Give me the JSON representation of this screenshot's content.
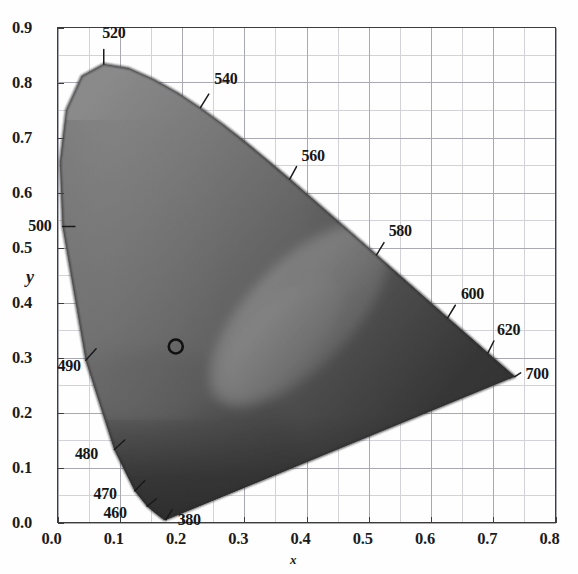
{
  "figure": {
    "kind": "cie-1931-chromaticity-diagram",
    "rendering": "grayscale halftone scan",
    "background_color": "#fefefe",
    "frame_color": "#4a4a4a",
    "grid_color": "#a8a8b0",
    "minor_grid_color": "#cfcfd6",
    "locus_outline_color": "#2a2a2a"
  },
  "axes": {
    "x_title": "x",
    "y_title": "y",
    "x_ticks": [
      "0.0",
      "0.1",
      "0.2",
      "0.3",
      "0.4",
      "0.5",
      "0.6",
      "0.7",
      "0.8"
    ],
    "y_ticks": [
      "0.0",
      "0.1",
      "0.2",
      "0.3",
      "0.4",
      "0.5",
      "0.6",
      "0.7",
      "0.8",
      "0.9"
    ],
    "x_range": [
      0.0,
      0.8
    ],
    "y_range": [
      0.0,
      0.9
    ],
    "major_step": 0.1,
    "minor_step": 0.05,
    "grid": true
  },
  "chart_data": {
    "type": "scatter",
    "title": "",
    "xlabel": "x",
    "ylabel": "y",
    "xlim": [
      0.0,
      0.8
    ],
    "ylim": [
      0.0,
      0.9
    ],
    "grid": true,
    "legend": "none",
    "spectral_locus": {
      "name": "spectral locus (CIE 1931 2-deg)",
      "closed_by": "line of purples",
      "points": [
        {
          "wl": 380,
          "x": 0.1741,
          "y": 0.005
        },
        {
          "wl": 390,
          "x": 0.1738,
          "y": 0.0049
        },
        {
          "wl": 400,
          "x": 0.1733,
          "y": 0.0048
        },
        {
          "wl": 410,
          "x": 0.1726,
          "y": 0.0048
        },
        {
          "wl": 420,
          "x": 0.1714,
          "y": 0.0051
        },
        {
          "wl": 430,
          "x": 0.1689,
          "y": 0.0069
        },
        {
          "wl": 440,
          "x": 0.1644,
          "y": 0.0109
        },
        {
          "wl": 450,
          "x": 0.1566,
          "y": 0.0177
        },
        {
          "wl": 460,
          "x": 0.144,
          "y": 0.0297
        },
        {
          "wl": 470,
          "x": 0.1241,
          "y": 0.0578
        },
        {
          "wl": 480,
          "x": 0.0913,
          "y": 0.1327
        },
        {
          "wl": 490,
          "x": 0.0454,
          "y": 0.295
        },
        {
          "wl": 500,
          "x": 0.0082,
          "y": 0.5384
        },
        {
          "wl": 505,
          "x": 0.0039,
          "y": 0.6548
        },
        {
          "wl": 510,
          "x": 0.0139,
          "y": 0.7502
        },
        {
          "wl": 515,
          "x": 0.0389,
          "y": 0.812
        },
        {
          "wl": 520,
          "x": 0.0743,
          "y": 0.8338
        },
        {
          "wl": 525,
          "x": 0.1142,
          "y": 0.8262
        },
        {
          "wl": 530,
          "x": 0.1547,
          "y": 0.8059
        },
        {
          "wl": 535,
          "x": 0.1929,
          "y": 0.7816
        },
        {
          "wl": 540,
          "x": 0.2296,
          "y": 0.7543
        },
        {
          "wl": 545,
          "x": 0.2658,
          "y": 0.7243
        },
        {
          "wl": 550,
          "x": 0.3016,
          "y": 0.6923
        },
        {
          "wl": 555,
          "x": 0.3373,
          "y": 0.6589
        },
        {
          "wl": 560,
          "x": 0.3731,
          "y": 0.6245
        },
        {
          "wl": 565,
          "x": 0.4087,
          "y": 0.5896
        },
        {
          "wl": 570,
          "x": 0.4441,
          "y": 0.5547
        },
        {
          "wl": 575,
          "x": 0.4788,
          "y": 0.5202
        },
        {
          "wl": 580,
          "x": 0.5125,
          "y": 0.4866
        },
        {
          "wl": 585,
          "x": 0.5448,
          "y": 0.4544
        },
        {
          "wl": 590,
          "x": 0.5752,
          "y": 0.4242
        },
        {
          "wl": 595,
          "x": 0.6029,
          "y": 0.3965
        },
        {
          "wl": 600,
          "x": 0.627,
          "y": 0.3725
        },
        {
          "wl": 605,
          "x": 0.6482,
          "y": 0.3514
        },
        {
          "wl": 610,
          "x": 0.6658,
          "y": 0.334
        },
        {
          "wl": 620,
          "x": 0.6915,
          "y": 0.3083
        },
        {
          "wl": 630,
          "x": 0.7079,
          "y": 0.292
        },
        {
          "wl": 640,
          "x": 0.719,
          "y": 0.2809
        },
        {
          "wl": 650,
          "x": 0.726,
          "y": 0.274
        },
        {
          "wl": 660,
          "x": 0.73,
          "y": 0.27
        },
        {
          "wl": 680,
          "x": 0.7334,
          "y": 0.2666
        },
        {
          "wl": 700,
          "x": 0.7347,
          "y": 0.2653
        }
      ]
    },
    "wavelength_labels": [
      {
        "text": "520",
        "wl": 520,
        "label_x": 0.072,
        "label_y": 0.888,
        "tick_from": [
          0.0743,
          0.86
        ],
        "tick_to": [
          0.0743,
          0.8338
        ]
      },
      {
        "text": "540",
        "wl": 540,
        "label_x": 0.252,
        "label_y": 0.805,
        "tick_from": [
          0.243,
          0.779
        ],
        "tick_to": [
          0.2296,
          0.7543
        ]
      },
      {
        "text": "560",
        "wl": 560,
        "label_x": 0.392,
        "label_y": 0.665,
        "tick_from": [
          0.384,
          0.647
        ],
        "tick_to": [
          0.3731,
          0.6245
        ]
      },
      {
        "text": "580",
        "wl": 580,
        "label_x": 0.532,
        "label_y": 0.528,
        "tick_from": [
          0.5245,
          0.509
        ],
        "tick_to": [
          0.5125,
          0.4866
        ]
      },
      {
        "text": "600",
        "wl": 600,
        "label_x": 0.648,
        "label_y": 0.414,
        "tick_from": [
          0.639,
          0.395
        ],
        "tick_to": [
          0.627,
          0.3725
        ]
      },
      {
        "text": "620",
        "wl": 620,
        "label_x": 0.706,
        "label_y": 0.348,
        "tick_from": [
          0.701,
          0.33
        ],
        "tick_to": [
          0.6915,
          0.3083
        ]
      },
      {
        "text": "700",
        "wl": 700,
        "label_x": 0.752,
        "label_y": 0.268,
        "tick_from": [
          0.744,
          0.272
        ],
        "tick_to": [
          0.7347,
          0.2653
        ]
      },
      {
        "text": "500",
        "wl": 500,
        "label_x": -0.047,
        "label_y": 0.537,
        "tick_from": [
          0.028,
          0.5384
        ],
        "tick_to": [
          0.0082,
          0.5384
        ]
      },
      {
        "text": "490",
        "wl": 490,
        "label_x": 0.0,
        "label_y": 0.283,
        "tick_from": [
          0.062,
          0.316
        ],
        "tick_to": [
          0.0454,
          0.295
        ]
      },
      {
        "text": "480",
        "wl": 480,
        "label_x": 0.028,
        "label_y": 0.122,
        "tick_from": [
          0.108,
          0.15
        ],
        "tick_to": [
          0.0913,
          0.1327
        ]
      },
      {
        "text": "470",
        "wl": 470,
        "label_x": 0.058,
        "label_y": 0.05,
        "tick_from": [
          0.14,
          0.076
        ],
        "tick_to": [
          0.1241,
          0.0578
        ]
      },
      {
        "text": "460",
        "wl": 460,
        "label_x": 0.074,
        "label_y": 0.015,
        "tick_from": [
          0.159,
          0.043
        ],
        "tick_to": [
          0.144,
          0.0297
        ]
      },
      {
        "text": "380",
        "wl": 380,
        "label_x": 0.193,
        "label_y": 0.002,
        "tick_from": [
          0.184,
          0.023
        ],
        "tick_to": [
          0.1741,
          0.005
        ]
      }
    ],
    "markers": [
      {
        "name": "white-point-marker",
        "shape": "open-circle",
        "x": 0.19,
        "y": 0.32,
        "radius_px": 7,
        "color": "#111111"
      }
    ]
  }
}
